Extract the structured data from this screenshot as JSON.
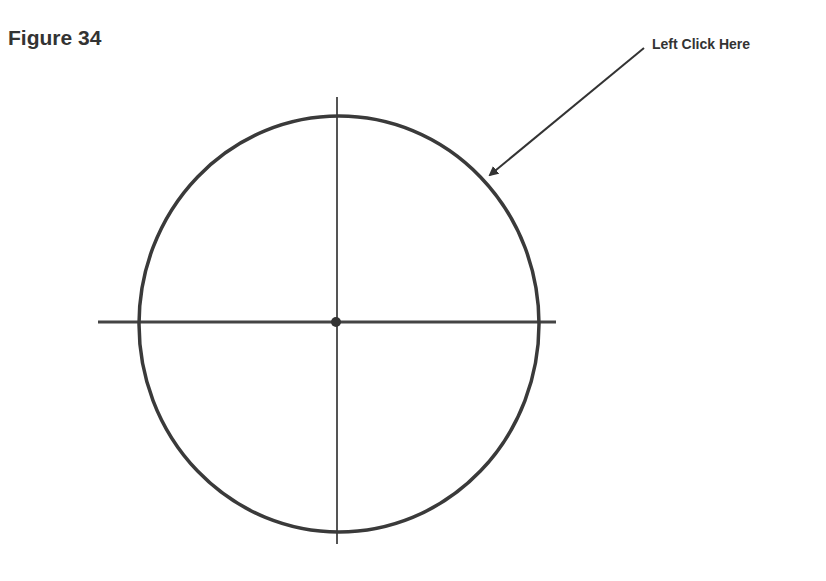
{
  "figure": {
    "title": "Figure 34",
    "callout_label": "Left Click Here"
  },
  "drawing": {
    "circle": {
      "cx": 339,
      "cy": 324,
      "rx": 200,
      "ry": 208,
      "stroke": "#3a3a3a"
    },
    "horizontal_axis": {
      "x1": 98,
      "y1": 322,
      "x2": 556,
      "y2": 322
    },
    "vertical_axis": {
      "x1": 337,
      "y1": 97,
      "x2": 337,
      "y2": 544
    },
    "center_point": {
      "cx": 336,
      "cy": 322
    },
    "arrow": {
      "from": [
        644,
        48
      ],
      "to": [
        486,
        178
      ]
    }
  },
  "colors": {
    "ink": "#333333",
    "background": "#ffffff"
  }
}
